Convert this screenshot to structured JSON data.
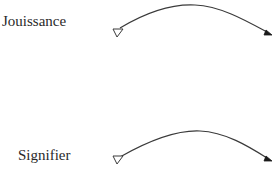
{
  "diagram": {
    "rows": [
      {
        "label": "Jouissance",
        "start_marker": "open-triangle",
        "end_marker": "filled-triangle"
      },
      {
        "label": "Signifier",
        "start_marker": "open-triangle",
        "end_marker": "filled-triangle"
      }
    ],
    "colors": {
      "stroke": "#3a3a3a",
      "text": "#2a2a2a",
      "background": "#ffffff"
    }
  }
}
